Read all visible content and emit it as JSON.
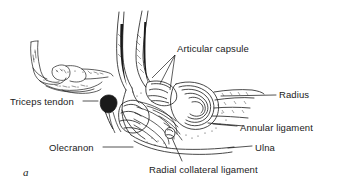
{
  "figure": {
    "letter": "a",
    "background_color": "#ffffff",
    "ink_color": "#1a1a1a"
  },
  "labels": {
    "articular_capsule": "Articular capsule",
    "radius": "Radius",
    "annular_ligament": "Annular ligament",
    "ulna": "Ulna",
    "olecranon": "Olecranon",
    "radial_collateral_ligament": "Radial collateral ligament",
    "triceps_tendon": "Triceps tendon"
  },
  "icons": {
    "inset": "skeleton-inset-icon",
    "main": "elbow-anatomy-illustration-icon"
  }
}
